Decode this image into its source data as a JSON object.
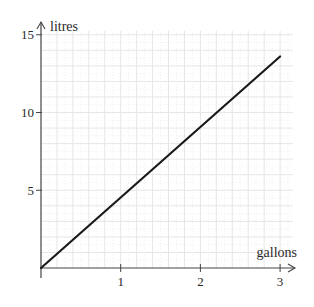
{
  "chart_data": {
    "type": "line",
    "title": "",
    "xlabel": "gallons",
    "ylabel": "litres",
    "x_ticks": [
      1,
      2,
      3
    ],
    "y_ticks": [
      5,
      10,
      15
    ],
    "xlim": [
      0,
      3.2
    ],
    "ylim": [
      0,
      15.8
    ],
    "grid": true,
    "legend": null,
    "series": [
      {
        "name": "litres vs gallons",
        "x": [
          0,
          3
        ],
        "y": [
          0,
          13.6
        ],
        "color": "#1a1a1a"
      }
    ]
  },
  "colors": {
    "axis": "#444444",
    "line": "#1a1a1a",
    "grid": "#e6e6e6",
    "grid_minor": "#efefef"
  }
}
